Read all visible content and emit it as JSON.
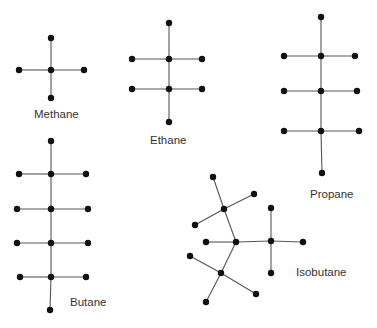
{
  "molecules": [
    {
      "name": "Methane",
      "carbons": 1,
      "hydrogens": 4
    },
    {
      "name": "Ethane",
      "carbons": 2,
      "hydrogens": 6
    },
    {
      "name": "Propane",
      "carbons": 3,
      "hydrogens": 8
    },
    {
      "name": "Butane",
      "carbons": 4,
      "hydrogens": 10
    },
    {
      "name": "Isobutane",
      "carbons": 4,
      "hydrogens": 10
    }
  ],
  "labels": {
    "methane": "Methane",
    "ethane": "Ethane",
    "propane": "Propane",
    "butane": "Butane",
    "isobutane": "Isobutane"
  },
  "colors": {
    "atom": "#111111",
    "bond": "#555555",
    "label": "#333333"
  }
}
